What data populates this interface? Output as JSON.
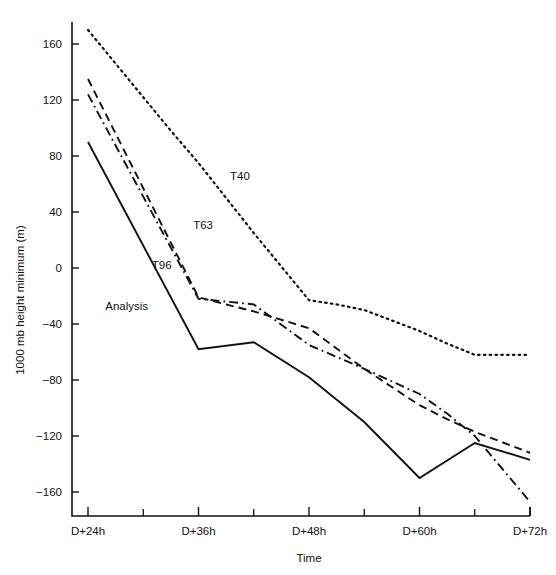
{
  "chart_data": {
    "type": "line",
    "title": "",
    "xlabel": "Time",
    "ylabel": "1000 mb height minimum (m)",
    "x_tick_labels": [
      "D+24h",
      "D+36h",
      "D+48h",
      "D+60h",
      "D+72h"
    ],
    "x_tick_hours": [
      24,
      36,
      48,
      60,
      72
    ],
    "x_minor_tick_hours": [
      30,
      42,
      54,
      66
    ],
    "y_tick_labels": [
      "160",
      "120",
      "80",
      "40",
      "0",
      "−40",
      "−80",
      "−120",
      "−160"
    ],
    "y_ticks": [
      160,
      120,
      80,
      40,
      0,
      -40,
      -80,
      -120,
      -160
    ],
    "xlim": [
      24,
      72
    ],
    "ylim": [
      -180,
      180
    ],
    "grid": false,
    "legend": "inline-annotations",
    "series": [
      {
        "name": "T40",
        "style": "dotted",
        "label_text": "T40",
        "x": [
          24,
          27,
          30,
          33,
          36,
          42,
          48,
          51,
          54,
          60,
          63,
          66,
          69,
          72
        ],
        "y": [
          170,
          146,
          122,
          98,
          75,
          25,
          -23,
          -26,
          -30,
          -45,
          -54,
          -62,
          -62,
          -62
        ]
      },
      {
        "name": "T63",
        "style": "dashed",
        "label_text": "T63",
        "x": [
          24,
          30,
          36,
          42,
          48,
          54,
          60,
          63,
          66,
          72
        ],
        "y": [
          135,
          57,
          -21,
          -31,
          -43,
          -72,
          -98,
          -108,
          -117,
          -132
        ]
      },
      {
        "name": "T96",
        "style": "dash-dot",
        "label_text": "T96",
        "x": [
          24,
          30,
          36,
          42,
          48,
          54,
          60,
          63,
          66,
          72
        ],
        "y": [
          124,
          51,
          -22,
          -26,
          -55,
          -72,
          -90,
          -104,
          -120,
          -167
        ]
      },
      {
        "name": "Analysis",
        "style": "solid",
        "label_text": "Analysis",
        "x": [
          24,
          36,
          42,
          48,
          54,
          60,
          66,
          72
        ],
        "y": [
          90,
          -58,
          -53,
          -78,
          -110,
          -150,
          -125,
          -137
        ]
      }
    ],
    "annotations": [
      {
        "text": "T40",
        "x_hours": 40.5,
        "y_value": 63
      },
      {
        "text": "T63",
        "x_hours": 36.5,
        "y_value": 28
      },
      {
        "text": "T96",
        "x_hours": 32.0,
        "y_value": -1
      },
      {
        "text": "Analysis",
        "x_hours": 28.2,
        "y_value": -30
      }
    ]
  },
  "colors": {
    "ink": "#111111",
    "background": "#ffffff"
  }
}
